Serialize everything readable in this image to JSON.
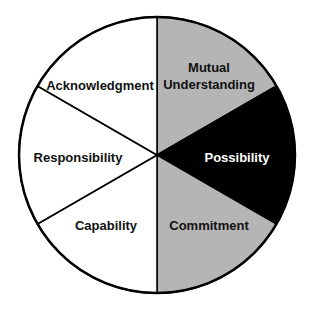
{
  "diagram": {
    "type": "wheel",
    "center": [
      157,
      155
    ],
    "radius": 138,
    "stroke_color": "#000000",
    "segments": [
      {
        "label_lines": [
          "Mutual",
          "Understanding"
        ],
        "fill": "#b5b5b5",
        "text_color": "#111111",
        "start_deg": 0,
        "end_deg": 60,
        "label_pos": [
          209,
          68
        ]
      },
      {
        "label_lines": [
          "Possibility"
        ],
        "fill": "#000000",
        "text_color": "#ffffff",
        "start_deg": 60,
        "end_deg": 120,
        "label_pos": [
          237,
          158
        ]
      },
      {
        "label_lines": [
          "Commitment"
        ],
        "fill": "#b5b5b5",
        "text_color": "#111111",
        "start_deg": 120,
        "end_deg": 180,
        "label_pos": [
          209,
          226
        ]
      },
      {
        "label_lines": [
          "Capability"
        ],
        "fill": "#ffffff",
        "text_color": "#111111",
        "start_deg": 180,
        "end_deg": 240,
        "label_pos": [
          106,
          226
        ]
      },
      {
        "label_lines": [
          "Responsibility"
        ],
        "fill": "#ffffff",
        "text_color": "#111111",
        "start_deg": 240,
        "end_deg": 300,
        "label_pos": [
          78,
          158
        ]
      },
      {
        "label_lines": [
          "Acknowledgment"
        ],
        "fill": "#ffffff",
        "text_color": "#111111",
        "start_deg": 300,
        "end_deg": 360,
        "label_pos": [
          100,
          86
        ]
      }
    ]
  },
  "labels": {
    "mutual": "Mutual",
    "understanding": "Understanding",
    "possibility": "Possibility",
    "commitment": "Commitment",
    "capability": "Capability",
    "responsibility": "Responsibility",
    "acknowledgment": "Acknowledgment"
  }
}
